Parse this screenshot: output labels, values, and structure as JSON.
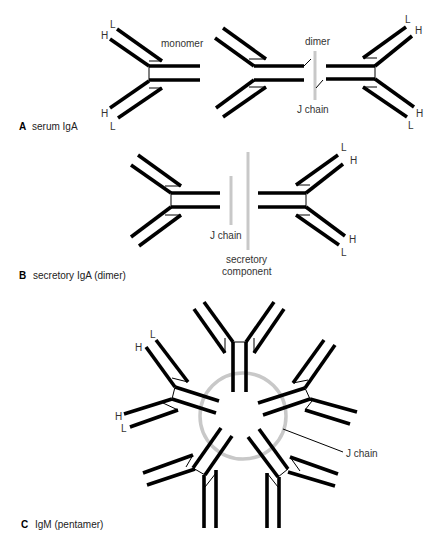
{
  "panels": {
    "a": {
      "letter": "A",
      "caption": "serum IgA",
      "monomer_label": "monomer",
      "dimer_label": "dimer",
      "j_chain_label": "J chain"
    },
    "b": {
      "letter": "B",
      "caption": "secretory IgA (dimer)",
      "j_chain_label": "J chain",
      "secretory_label_line1": "secretory",
      "secretory_label_line2": "component"
    },
    "c": {
      "letter": "C",
      "caption": "IgM (pentamer)",
      "j_chain_label": "J chain"
    }
  },
  "chain_labels": {
    "heavy": "H",
    "light": "L"
  },
  "colors": {
    "chain": "#000000",
    "j_chain": "#c8c8c8",
    "text": "#333333"
  }
}
